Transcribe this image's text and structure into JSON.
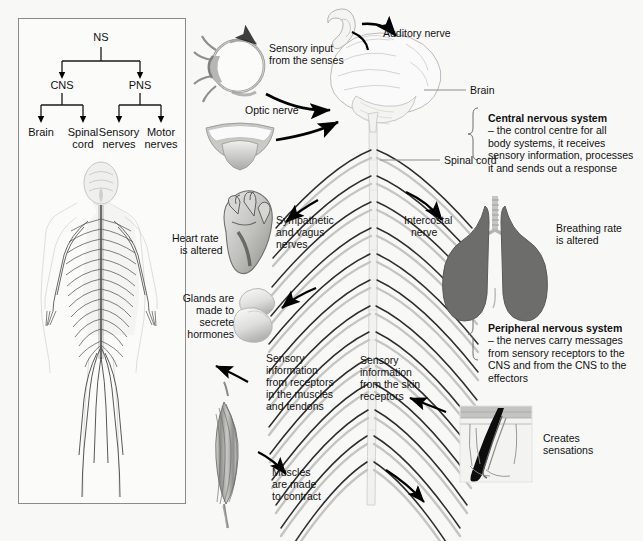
{
  "figure": {
    "background_color": "#f8f8f7",
    "panel_border_color": "#8b8b8b"
  },
  "classification_panel": {
    "name": "nervous-system-classification-tree",
    "root": "NS",
    "level2": [
      "CNS",
      "PNS"
    ],
    "level3": [
      "Brain",
      "Spinal cord",
      "Sensory nerves",
      "Motor nerves"
    ],
    "level3_wrapped": [
      [
        "Brain"
      ],
      [
        "Spinal",
        "cord"
      ],
      [
        "Sensory",
        "nerves"
      ],
      [
        "Motor",
        "nerves"
      ]
    ],
    "figure_caption": "full body nervous system illustration"
  },
  "main_labels": {
    "sensory_input": [
      "Sensory input",
      "from the senses"
    ],
    "auditory_nerve": "Auditory nerve",
    "optic_nerve": "Optic nerve",
    "brain": "Brain",
    "spinal_cord": "Spinal cord",
    "sympathetic_vagus": [
      "Sympathetic",
      "and vagus",
      "nerves"
    ],
    "intercostal_nerve": [
      "Intercostal",
      "nerve"
    ],
    "heart_rate": [
      "Heart rate",
      "is altered"
    ],
    "breathing_rate": [
      "Breathing rate",
      "is altered"
    ],
    "glands": [
      "Glands are",
      "made to",
      "secrete",
      "hormones"
    ],
    "muscle_sensory": [
      "Sensory",
      "information",
      "from receptors",
      "in the muscles",
      "and tendons"
    ],
    "skin_sensory": [
      "Sensory",
      "information",
      "from the skin",
      "receptors"
    ],
    "muscles_contract": [
      "Muscles",
      "are made",
      "to contract"
    ],
    "creates_sensations": [
      "Creates",
      "sensations"
    ]
  },
  "side_notes": [
    {
      "id": "central-nervous-system",
      "heading": "Central nervous system",
      "body": [
        "– the control centre for all",
        "body systems, it receives",
        "sensory information, processes",
        "it and sends out a response"
      ]
    },
    {
      "id": "peripheral-nervous-system",
      "heading": "Peripheral nervous system",
      "body": [
        "– the nerves carry messages",
        "from sensory receptors to the",
        "CNS and from the CNS to the",
        "effectors"
      ]
    }
  ],
  "organs": [
    {
      "id": "eye",
      "name": "eye"
    },
    {
      "id": "ear",
      "name": "ear"
    },
    {
      "id": "mouth",
      "name": "mouth-tongue"
    },
    {
      "id": "brain",
      "name": "brain"
    },
    {
      "id": "heart",
      "name": "heart"
    },
    {
      "id": "lungs",
      "name": "lungs"
    },
    {
      "id": "gland",
      "name": "adrenal-gland"
    },
    {
      "id": "muscle",
      "name": "skeletal-muscle"
    },
    {
      "id": "skin",
      "name": "skin-cross-section"
    }
  ]
}
